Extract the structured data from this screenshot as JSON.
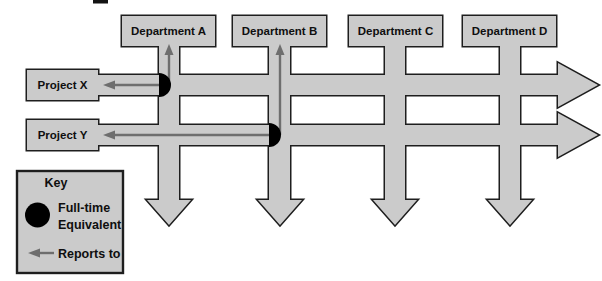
{
  "diagram": {
    "departments": [
      {
        "label": "Department A"
      },
      {
        "label": "Department B"
      },
      {
        "label": "Department C"
      },
      {
        "label": "Department D"
      }
    ],
    "projects": [
      {
        "label": "Project X"
      },
      {
        "label": "Project Y"
      }
    ],
    "fte_markers": [
      {
        "project": "Project X",
        "department": "Department A"
      },
      {
        "project": "Project Y",
        "department": "Department B"
      }
    ],
    "reports_to_arrows": [
      {
        "from": "Department A column",
        "to": "Project X"
      },
      {
        "from": "Project X row",
        "to": "Department A"
      },
      {
        "from": "Department B column",
        "to": "Project Y"
      },
      {
        "from": "Project Y row",
        "to": "Department B"
      }
    ],
    "key": {
      "title": "Key",
      "fte_label_line1": "Full-time",
      "fte_label_line2": "Equivalent",
      "reports_label": "Reports to"
    },
    "colors": {
      "shape_fill": "#cbcbcb",
      "shape_stroke": "#1e1e1e",
      "fte_marker_fill": "#000000",
      "reports_arrow": "#6e6e6e",
      "text": "#0f0f0f"
    }
  }
}
